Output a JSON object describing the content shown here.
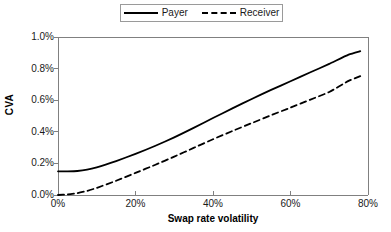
{
  "chart_data": {
    "type": "line",
    "title": "",
    "xlabel": "Swap rate volatility",
    "ylabel": "CVA",
    "xlim": [
      0,
      80
    ],
    "ylim": [
      0,
      1.0
    ],
    "xticks": [
      "0%",
      "20%",
      "40%",
      "60%",
      "80%"
    ],
    "xtick_values": [
      0,
      20,
      40,
      60,
      80
    ],
    "yticks": [
      "0.0%",
      "0.2%",
      "0.4%",
      "0.6%",
      "0.8%",
      "1.0%"
    ],
    "ytick_values": [
      0.0,
      0.2,
      0.4,
      0.6,
      0.8,
      1.0
    ],
    "grid": false,
    "legend_position": "top-center",
    "x": [
      0,
      2.5,
      5,
      7.5,
      10,
      15,
      20,
      25,
      30,
      35,
      40,
      45,
      50,
      55,
      60,
      65,
      70,
      75,
      78
    ],
    "series": [
      {
        "name": "Payer",
        "style": "solid",
        "color": "#000000",
        "values": [
          0.15,
          0.15,
          0.152,
          0.16,
          0.175,
          0.215,
          0.26,
          0.31,
          0.365,
          0.425,
          0.487,
          0.548,
          0.608,
          0.665,
          0.72,
          0.775,
          0.83,
          0.888,
          0.91
        ]
      },
      {
        "name": "Receiver",
        "style": "dashed",
        "color": "#000000",
        "values": [
          0.0,
          0.004,
          0.012,
          0.026,
          0.045,
          0.09,
          0.14,
          0.19,
          0.243,
          0.298,
          0.353,
          0.405,
          0.455,
          0.505,
          0.553,
          0.602,
          0.652,
          0.722,
          0.752
        ]
      }
    ]
  },
  "legend": {
    "entries": [
      {
        "label": "Payer",
        "style": "solid"
      },
      {
        "label": "Receiver",
        "style": "dashed"
      }
    ]
  },
  "axes": {
    "y_title": "CVA",
    "x_title": "Swap rate volatility"
  },
  "colors": {
    "line": "#000000",
    "axis": "#808080",
    "legend_border": "#9a9a9a",
    "background": "#ffffff"
  }
}
